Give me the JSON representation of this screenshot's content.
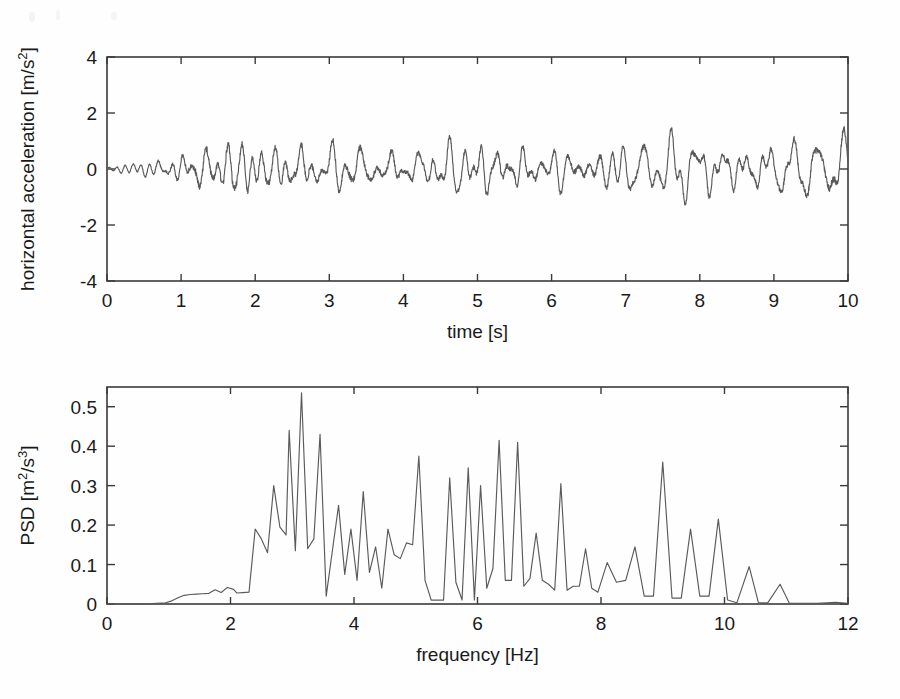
{
  "figure": {
    "name": "acceleration-time-history-and-psd",
    "background_color": "#fefefe",
    "line_color": "#5a5a5a",
    "axis_color": "#3a3a3a"
  },
  "chart_data": [
    {
      "type": "line",
      "name": "time-history",
      "title": "",
      "xlabel": "time [s]",
      "ylabel": "horizontal acceleration [m/s²]",
      "ylabel_base": "horizontal acceleration [m/s",
      "ylabel_exp": "2",
      "ylabel_tail": "]",
      "xlim": [
        0,
        10
      ],
      "ylim": [
        -4,
        4
      ],
      "xticks": [
        0,
        1,
        2,
        3,
        4,
        5,
        6,
        7,
        8,
        9,
        10
      ],
      "xticklabels": [
        "0",
        "1",
        "2",
        "3",
        "4",
        "5",
        "6",
        "7",
        "8",
        "9",
        "10"
      ],
      "yticks": [
        -4,
        -2,
        0,
        2,
        4
      ],
      "yticklabels": [
        "-4",
        "-2",
        "0",
        "2",
        "4"
      ],
      "grid": false,
      "legend": "none",
      "series": [
        {
          "name": "horizontal acceleration",
          "description": "Growing self-excited oscillation from rest, saturating into a chaotic limit cycle of about +/-3 m/s^2 amplitude.",
          "model": {
            "kind": "growing-chaotic-oscillation",
            "t_start": 0,
            "t_end": 10,
            "samples": 2600,
            "envelope_points": [
              [
                0.0,
                0.1
              ],
              [
                0.15,
                0.28
              ],
              [
                0.3,
                0.5
              ],
              [
                0.5,
                0.72
              ],
              [
                0.7,
                0.95
              ],
              [
                0.9,
                1.45
              ],
              [
                1.05,
                2.3
              ],
              [
                1.2,
                3.35
              ],
              [
                1.45,
                3.45
              ],
              [
                1.7,
                3.55
              ],
              [
                2.0,
                3.05
              ],
              [
                2.4,
                2.95
              ],
              [
                2.8,
                2.95
              ],
              [
                3.2,
                3.05
              ],
              [
                3.6,
                2.95
              ],
              [
                4.0,
                2.45
              ],
              [
                4.5,
                2.45
              ],
              [
                5.0,
                2.7
              ],
              [
                5.5,
                2.55
              ],
              [
                6.0,
                2.55
              ],
              [
                6.5,
                2.7
              ],
              [
                7.0,
                2.5
              ],
              [
                7.5,
                2.55
              ],
              [
                8.0,
                2.5
              ],
              [
                8.5,
                2.55
              ],
              [
                9.0,
                2.7
              ],
              [
                9.5,
                3.15
              ],
              [
                10.0,
                3.3
              ]
            ],
            "carrier_frequencies_hz": [
              3.05,
              5.05,
              6.4,
              2.6,
              9.0,
              4.3,
              7.4
            ],
            "carrier_weights": [
              1.0,
              0.55,
              0.5,
              0.45,
              0.3,
              0.35,
              0.25
            ],
            "early_frequency_hz": 9.2,
            "early_fade_time": 1.15
          }
        }
      ]
    },
    {
      "type": "line",
      "name": "power-spectral-density",
      "title": "",
      "xlabel": "frequency [Hz]",
      "ylabel": "PSD [m²/s³]",
      "ylabel_base": "PSD [m",
      "ylabel_exp": "2",
      "ylabel_mid": "/s",
      "ylabel_exp2": "3",
      "ylabel_tail": "]",
      "xlim": [
        0,
        12
      ],
      "ylim": [
        0,
        0.55
      ],
      "xticks": [
        0,
        2,
        4,
        6,
        8,
        10,
        12
      ],
      "xticklabels": [
        "0",
        "2",
        "4",
        "6",
        "8",
        "10",
        "12"
      ],
      "yticks": [
        0,
        0.1,
        0.2,
        0.3,
        0.4,
        0.5
      ],
      "yticklabels": [
        "0",
        "0.1",
        "0.2",
        "0.3",
        "0.4",
        "0.5"
      ],
      "grid": false,
      "legend": "none",
      "series": [
        {
          "name": "PSD",
          "x": [
            0.0,
            0.2,
            0.4,
            0.6,
            0.8,
            0.95,
            1.05,
            1.15,
            1.25,
            1.35,
            1.45,
            1.55,
            1.65,
            1.75,
            1.85,
            1.95,
            2.05,
            2.1,
            2.2,
            2.3,
            2.4,
            2.5,
            2.6,
            2.7,
            2.8,
            2.9,
            2.95,
            3.05,
            3.15,
            3.25,
            3.35,
            3.45,
            3.55,
            3.65,
            3.75,
            3.85,
            3.95,
            4.05,
            4.15,
            4.25,
            4.35,
            4.45,
            4.55,
            4.65,
            4.75,
            4.85,
            4.95,
            5.05,
            5.15,
            5.25,
            5.35,
            5.45,
            5.55,
            5.65,
            5.75,
            5.85,
            5.95,
            6.05,
            6.15,
            6.25,
            6.35,
            6.45,
            6.55,
            6.65,
            6.75,
            6.85,
            6.95,
            7.05,
            7.15,
            7.25,
            7.35,
            7.45,
            7.55,
            7.65,
            7.75,
            7.85,
            7.95,
            8.1,
            8.25,
            8.4,
            8.55,
            8.7,
            8.85,
            9.0,
            9.15,
            9.3,
            9.45,
            9.6,
            9.75,
            9.9,
            10.05,
            10.2,
            10.4,
            10.55,
            10.7,
            10.9,
            11.05,
            11.2,
            11.5,
            11.8,
            12.0
          ],
          "y": [
            0.0,
            0.0,
            0.0,
            0.0,
            0.002,
            0.003,
            0.008,
            0.016,
            0.022,
            0.024,
            0.025,
            0.026,
            0.027,
            0.036,
            0.029,
            0.042,
            0.037,
            0.028,
            0.029,
            0.03,
            0.19,
            0.165,
            0.13,
            0.3,
            0.195,
            0.175,
            0.44,
            0.135,
            0.535,
            0.14,
            0.165,
            0.43,
            0.02,
            0.135,
            0.25,
            0.075,
            0.19,
            0.06,
            0.285,
            0.08,
            0.145,
            0.04,
            0.19,
            0.125,
            0.115,
            0.155,
            0.15,
            0.375,
            0.06,
            0.01,
            0.01,
            0.01,
            0.32,
            0.055,
            0.01,
            0.345,
            0.01,
            0.3,
            0.04,
            0.09,
            0.415,
            0.06,
            0.06,
            0.41,
            0.045,
            0.065,
            0.18,
            0.06,
            0.05,
            0.035,
            0.305,
            0.035,
            0.045,
            0.045,
            0.14,
            0.04,
            0.03,
            0.105,
            0.055,
            0.06,
            0.145,
            0.02,
            0.02,
            0.36,
            0.015,
            0.015,
            0.19,
            0.02,
            0.02,
            0.215,
            0.01,
            0.003,
            0.095,
            0.003,
            0.003,
            0.05,
            0.002,
            0.002,
            0.002,
            0.004,
            0.002
          ],
          "peaks": [
            {
              "frequency": 3.15,
              "value": 0.535,
              "label": "dominant"
            },
            {
              "frequency": 2.95,
              "value": 0.44
            },
            {
              "frequency": 3.45,
              "value": 0.43
            },
            {
              "frequency": 6.35,
              "value": 0.415
            },
            {
              "frequency": 6.65,
              "value": 0.41
            },
            {
              "frequency": 5.05,
              "value": 0.375
            },
            {
              "frequency": 9.0,
              "value": 0.36
            },
            {
              "frequency": 5.85,
              "value": 0.345
            },
            {
              "frequency": 5.55,
              "value": 0.32
            },
            {
              "frequency": 7.35,
              "value": 0.305
            },
            {
              "frequency": 2.7,
              "value": 0.3
            },
            {
              "frequency": 6.05,
              "value": 0.3
            },
            {
              "frequency": 4.15,
              "value": 0.285
            },
            {
              "frequency": 3.75,
              "value": 0.25
            },
            {
              "frequency": 9.9,
              "value": 0.215
            },
            {
              "frequency": 9.45,
              "value": 0.19
            }
          ]
        }
      ]
    }
  ]
}
